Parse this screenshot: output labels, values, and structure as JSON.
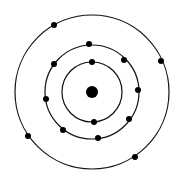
{
  "diagram": {
    "type": "bohr-atom-model",
    "colors": {
      "background": "#ffffff",
      "stroke": "#111111",
      "fill": "#000000"
    },
    "nucleus": {
      "cx": 92,
      "cy": 92,
      "r": 6
    },
    "shells": [
      {
        "name": "inner-shell",
        "r": 30,
        "electrons": [
          [
            92,
            62
          ],
          [
            94,
            122
          ]
        ]
      },
      {
        "name": "middle-shell",
        "r": 47,
        "electrons": [
          [
            89,
            44
          ],
          [
            124,
            60
          ],
          [
            138,
            90
          ],
          [
            129,
            119
          ],
          [
            98,
            138
          ],
          [
            63,
            130
          ],
          [
            46,
            99
          ],
          [
            54,
            64
          ]
        ]
      },
      {
        "name": "outer-shell",
        "r": 77,
        "electrons": [
          [
            54,
            25
          ],
          [
            161,
            61
          ],
          [
            135,
            157
          ],
          [
            28,
            136
          ]
        ]
      }
    ],
    "electron_radius": 3,
    "electron_count": 14
  }
}
